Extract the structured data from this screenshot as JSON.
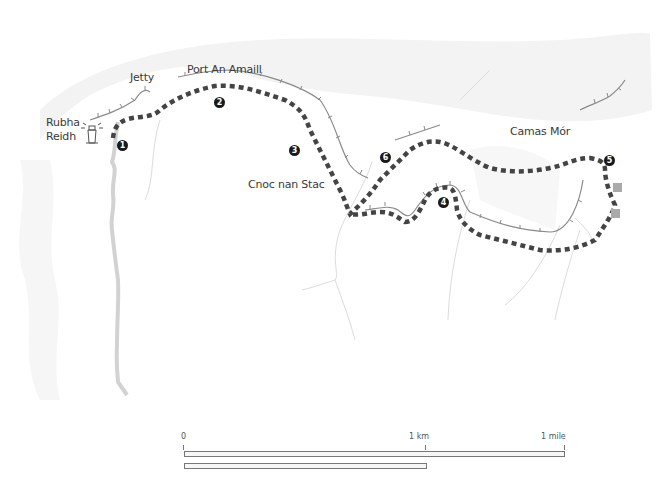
{
  "map": {
    "labels": {
      "rubha_reidh_line1": "Rubha",
      "rubha_reidh_line2": "Reidh",
      "jetty": "Jetty",
      "port_an_amaill": "Port An Amaill",
      "cnoc_nan_stac": "Cnoc nan Stac",
      "camas_mor": "Camas Mór"
    },
    "waypoints": [
      "1",
      "2",
      "3",
      "4",
      "5",
      "6"
    ],
    "icons": {
      "lighthouse": "lighthouse-icon",
      "buildings": "building-icon"
    },
    "colors": {
      "route": "#444444",
      "waypoint": "#1a1a1a",
      "road": "#d0d0d0",
      "coast": "#888888",
      "stream": "#dddddd",
      "terrain": "#f2f2f2",
      "building": "#aaaaaa"
    }
  },
  "scale": {
    "zero": "0",
    "km": "1 km",
    "mile": "1 mile"
  }
}
